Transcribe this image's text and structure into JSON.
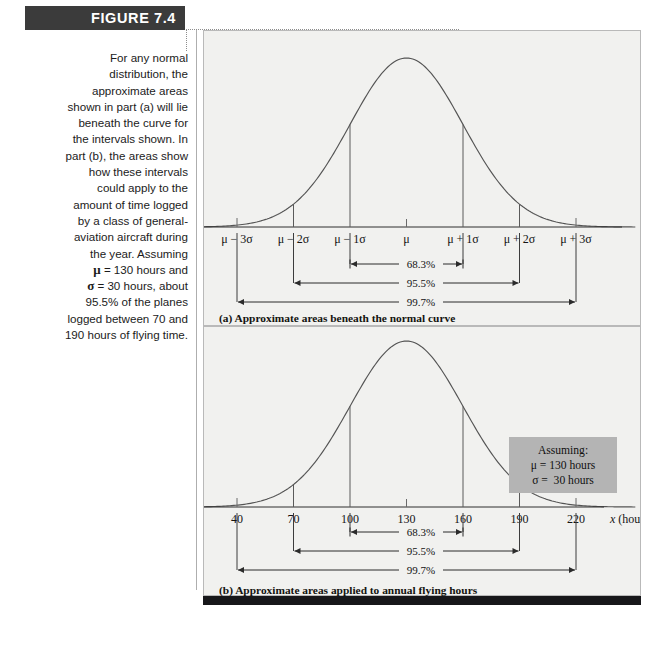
{
  "figure": {
    "banner_label": "FIGURE 7.4",
    "caption_lines": [
      "For any normal",
      "distribution, the",
      "approximate areas",
      "shown in part (a) will lie",
      "beneath the curve for",
      "the intervals shown. In",
      "part (b), the areas show",
      "how these intervals",
      "could apply to the",
      "amount of time logged",
      "by a class of general-",
      "aviation aircraft during",
      "the year. Assuming",
      "μ = 130 hours and",
      "σ = 30 hours, about",
      "95.5% of the planes",
      "logged between 70 and",
      "190 hours of flying time."
    ],
    "subcaption_a": "(a) Approximate areas beneath the normal curve",
    "subcaption_b": "(b) Approximate areas applied to annual flying hours",
    "assuming_box": {
      "title": "Assuming:",
      "mu_line": "μ = 130 hours",
      "sigma_line": "σ =  30 hours"
    },
    "colors": {
      "banner": "#3b3b3b",
      "panel_bg": "#f1f1ef",
      "curve": "#4a4a4a",
      "assuming_bg": "#b4b4b4",
      "bottom_bar": "#17171a"
    }
  },
  "chart_data": [
    {
      "type": "line",
      "title": "(a) Approximate areas beneath the normal curve",
      "xlabel": "",
      "ylabel": "",
      "curve": "normal density",
      "mean_label": "μ",
      "tick_labels": [
        "μ − 3σ",
        "μ − 2σ",
        "μ − 1σ",
        "μ",
        "μ + 1σ",
        "μ + 2σ",
        "μ + 3σ"
      ],
      "tick_z": [
        -3,
        -2,
        -1,
        0,
        1,
        2,
        3
      ],
      "intervals": [
        {
          "label": "68.3%",
          "from_z": -1,
          "to_z": 1
        },
        {
          "label": "95.5%",
          "from_z": -2,
          "to_z": 2
        },
        {
          "label": "99.7%",
          "from_z": -3,
          "to_z": 3
        }
      ]
    },
    {
      "type": "line",
      "title": "(b) Approximate areas applied to annual flying hours",
      "xlabel": "x  (hours)",
      "ylabel": "",
      "curve": "normal density",
      "mu": 130,
      "sigma": 30,
      "tick_labels": [
        "40",
        "70",
        "100",
        "130",
        "160",
        "190",
        "220"
      ],
      "tick_values": [
        40,
        70,
        100,
        130,
        160,
        190,
        220
      ],
      "tick_z": [
        -3,
        -2,
        -1,
        0,
        1,
        2,
        3
      ],
      "intervals": [
        {
          "label": "68.3%",
          "from": 100,
          "to": 160
        },
        {
          "label": "95.5%",
          "from": 70,
          "to": 190
        },
        {
          "label": "99.7%",
          "from": 40,
          "to": 220
        }
      ]
    }
  ]
}
